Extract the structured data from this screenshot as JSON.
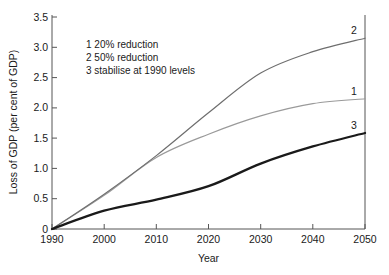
{
  "chart_data": {
    "type": "line",
    "title": "",
    "xlabel": "Year",
    "ylabel": "Loss of GDP (per cent of GDP)",
    "xlim": [
      1990,
      2050
    ],
    "ylim": [
      0,
      3.5
    ],
    "grid": false,
    "legend_position": "inside-top-left",
    "xticks": [
      "1990",
      "2000",
      "2010",
      "2020",
      "2030",
      "2040",
      "2050"
    ],
    "xtick_values": [
      1990,
      2000,
      2010,
      2020,
      2030,
      2040,
      2050
    ],
    "yticks": [
      "0",
      "0.5",
      "1.0",
      "1.5",
      "2.0",
      "2.5",
      "3.0",
      "3.5"
    ],
    "ytick_values": [
      0,
      0.5,
      1.0,
      1.5,
      2.0,
      2.5,
      3.0,
      3.5
    ],
    "x": [
      1990,
      2000,
      2010,
      2020,
      2030,
      2040,
      2050
    ],
    "series": [
      {
        "name": "1",
        "label": "20% reduction",
        "legend_text": "1  20% reduction",
        "color": "#9a9a9a",
        "width": 1.2,
        "end_tag": "1",
        "values": [
          0.0,
          0.55,
          1.17,
          1.55,
          1.85,
          2.05,
          2.13
        ]
      },
      {
        "name": "2",
        "label": "50% reduction",
        "legend_text": "2  50% reduction",
        "color": "#6e6e6e",
        "width": 1.2,
        "end_tag": "2",
        "values": [
          0.0,
          0.57,
          1.2,
          1.9,
          2.55,
          2.9,
          3.12
        ]
      },
      {
        "name": "3",
        "label": "stabilise at 1990 levels",
        "legend_text": "3  stabilise at 1990 levels",
        "color": "#1a1a1a",
        "width": 2.3,
        "end_tag": "3",
        "values": [
          0.0,
          0.3,
          0.48,
          0.7,
          1.07,
          1.35,
          1.57
        ]
      }
    ],
    "legend_entries": [
      {
        "marker": "1",
        "text": "20% reduction"
      },
      {
        "marker": "2",
        "text": "50% reduction"
      },
      {
        "marker": "3",
        "text": "stabilise at 1990 levels"
      }
    ],
    "colors": {
      "axis": "#555555",
      "text": "#1a1a1a",
      "background": "#ffffff",
      "series_1": "#9a9a9a",
      "series_2": "#6e6e6e",
      "series_3": "#1a1a1a"
    }
  }
}
